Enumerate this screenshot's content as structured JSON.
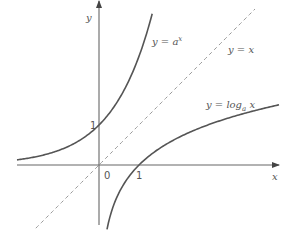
{
  "diagram": {
    "axes": {
      "x_label": "x",
      "y_label": "y",
      "origin_label": "0",
      "x_tick_label": "1",
      "y_tick_label": "1",
      "x_range": [
        -2.05,
        4.5
      ],
      "y_range": [
        -1.5,
        4.1
      ]
    },
    "curves": [
      {
        "id": "exponential",
        "label_lhs": "y = a",
        "label_sup": "x",
        "function": "a^x",
        "base": 2.718,
        "x_range": [
          -2.05,
          1.33
        ],
        "style": "solid",
        "color": "#555555"
      },
      {
        "id": "logarithm",
        "label_lhs": "y = log",
        "label_sub": "a",
        "label_rhs": " x",
        "function": "log_a x",
        "base": 2.718,
        "x_range": [
          0.2,
          4.5
        ],
        "style": "solid",
        "color": "#555555"
      },
      {
        "id": "identity",
        "label": "y = x",
        "function": "x",
        "x_range": [
          -1.58,
          3.9
        ],
        "style": "dashed",
        "color": "#999999"
      }
    ],
    "axis_color": "#555555"
  }
}
